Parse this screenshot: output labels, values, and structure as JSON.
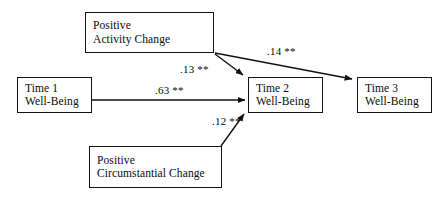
{
  "diagram": {
    "type": "path-model",
    "title": "",
    "background_color": "#ffffff",
    "line_color": "#111111",
    "text_color": "#0a0a0a",
    "nodes": [
      {
        "id": "activity",
        "name": "positive-activity-change",
        "line1": "Positive",
        "line2": "Activity Change"
      },
      {
        "id": "time1",
        "name": "time-1-well-being",
        "line1": "Time 1",
        "line2": "Well-Being"
      },
      {
        "id": "time2",
        "name": "time-2-well-being",
        "line1": "Time 2",
        "line2": "Well-Being"
      },
      {
        "id": "time3",
        "name": "time-3-well-being",
        "line1": "Time 3",
        "line2": "Well-Being"
      },
      {
        "id": "circumstantial",
        "name": "positive-circumstantial-change",
        "line1": "Positive",
        "line2": "Circumstantial Change"
      }
    ],
    "paths": [
      {
        "id": "p13",
        "from": "activity",
        "to": "time2",
        "coefficient": ".13",
        "significance": "**",
        "label": ".13 **"
      },
      {
        "id": "p14",
        "from": "activity",
        "to": "time3",
        "coefficient": ".14",
        "significance": "**",
        "label": ".14 **"
      },
      {
        "id": "p63",
        "from": "time1",
        "to": "time2",
        "coefficient": ".63",
        "significance": "**",
        "label": ".63 **"
      },
      {
        "id": "p12",
        "from": "circumstantial",
        "to": "time2",
        "coefficient": ".12",
        "significance": "**",
        "label": ".12 **"
      }
    ]
  }
}
